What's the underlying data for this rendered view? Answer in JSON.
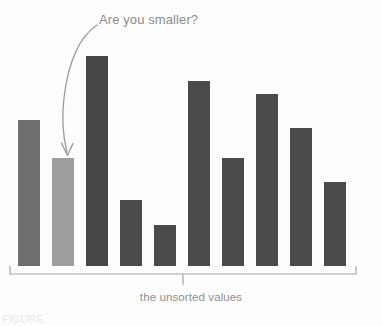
{
  "figure": {
    "background_color": "#fdfdfd",
    "annotation": {
      "text": "Are you smaller?",
      "color": "#8b8b8b",
      "points_to_bar_index": 1
    },
    "bracket": {
      "label": "the unsorted values",
      "color": "#9a9a9a"
    },
    "edge_fragment": {
      "text": "FIGURE"
    }
  },
  "chart_data": {
    "type": "bar",
    "title": "",
    "subtitle": "",
    "xlabel": "the unsorted values",
    "ylabel": "",
    "grid": false,
    "legend": null,
    "axis_visible": false,
    "categories": [
      "1",
      "2",
      "3",
      "4",
      "5",
      "6",
      "7",
      "8",
      "9",
      "10"
    ],
    "values": [
      146,
      108,
      210,
      66,
      41,
      185,
      108,
      172,
      138,
      84
    ],
    "ylim": [
      0,
      220
    ],
    "bar_colors": [
      "#6e6e6e",
      "#9d9d9d",
      "#474747",
      "#4b4b4b",
      "#4b4b4b",
      "#4b4b4b",
      "#4b4b4b",
      "#4b4b4b",
      "#4b4b4b",
      "#4b4b4b"
    ],
    "highlight_index": 1,
    "highlight_color": "#9d9d9d",
    "default_color": "#4b4b4b",
    "annotations": [
      {
        "text": "Are you smaller?",
        "target_category": "2",
        "style": "curved-arrow"
      }
    ],
    "baseline_y": 266,
    "bar_width": 22,
    "bar_pitch": 34,
    "first_bar_x": 18
  }
}
